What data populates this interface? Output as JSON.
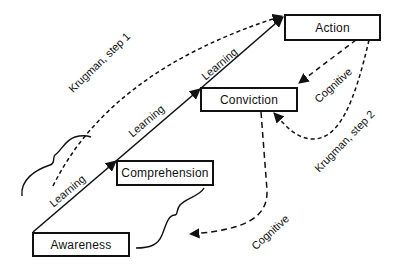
{
  "diagram": {
    "type": "hierarchy-of-effects flow",
    "nodes": [
      {
        "id": "awareness",
        "label": "Awareness"
      },
      {
        "id": "comprehension",
        "label": "Comprehension"
      },
      {
        "id": "conviction",
        "label": "Conviction"
      },
      {
        "id": "action",
        "label": "Action"
      }
    ],
    "edges": [
      {
        "from": "awareness",
        "to": "comprehension",
        "label": "Learning",
        "style": "solid"
      },
      {
        "from": "comprehension",
        "to": "conviction",
        "label": "Learning",
        "style": "solid"
      },
      {
        "from": "conviction",
        "to": "action",
        "label": "Learning",
        "style": "solid"
      },
      {
        "from": "awareness",
        "to": "action",
        "label": "Krugman, step 1",
        "style": "dashed"
      },
      {
        "from": "action",
        "to": "conviction",
        "label": "Cognitive",
        "style": "dashed"
      },
      {
        "from": "action",
        "to": "conviction",
        "label": "Krugman, step 2",
        "style": "dashed"
      },
      {
        "from": "conviction",
        "to": "awareness",
        "label": "Cognitive",
        "style": "dashed"
      }
    ],
    "labels": {
      "learning_1": "Learning",
      "learning_2": "Learning",
      "learning_3": "Learning",
      "krugman_step1": "Krugman, step 1",
      "krugman_step2": "Krugman, step 2",
      "cognitive_upper": "Cognitive",
      "cognitive_lower": "Cognitive"
    },
    "colors": {
      "stroke": "#111111",
      "background": "#ffffff"
    }
  }
}
